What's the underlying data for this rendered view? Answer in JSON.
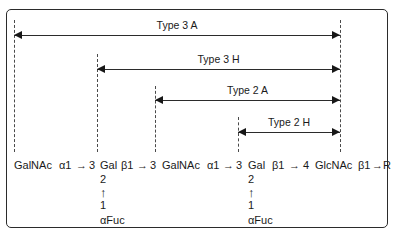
{
  "figure": {
    "name": "glycan-type-structure-diagram",
    "border_color": "#2b2b2b",
    "line_color": "#2b2b2b",
    "dash_color": "#4a4a4a"
  },
  "measures": [
    {
      "id": "type-3-a",
      "label": "Type 3 A",
      "left": 14,
      "right": 340,
      "y": 35,
      "label_y": 19
    },
    {
      "id": "type-3-h",
      "label": "Type 3 H",
      "left": 97,
      "right": 340,
      "y": 69,
      "label_y": 53
    },
    {
      "id": "type-2-a",
      "label": "Type 2 A",
      "left": 155,
      "right": 340,
      "y": 100,
      "label_y": 84
    },
    {
      "id": "type-2-h",
      "label": "Type 2 H",
      "left": 238,
      "right": 340,
      "y": 132,
      "label_y": 116
    }
  ],
  "guides": [
    {
      "id": "guide-galnac-1",
      "x": 14,
      "top": 20,
      "bottom": 152
    },
    {
      "id": "guide-gal-1",
      "x": 97,
      "top": 54,
      "bottom": 152
    },
    {
      "id": "guide-galnac-2",
      "x": 155,
      "top": 86,
      "bottom": 152
    },
    {
      "id": "guide-gal-2",
      "x": 238,
      "top": 117,
      "bottom": 152
    },
    {
      "id": "guide-terminus",
      "x": 340,
      "top": 20,
      "bottom": 152
    }
  ],
  "chain": {
    "segments": [
      {
        "id": "residue-galnac-1",
        "text": "GalNAc",
        "x": 14
      },
      {
        "id": "linkage-alpha1-1",
        "text": "α1",
        "x": 59
      },
      {
        "id": "arrow-1",
        "text": "→",
        "x": 76
      },
      {
        "id": "position-3-1",
        "text": "3",
        "x": 89
      },
      {
        "id": "residue-gal-1",
        "text": "Gal",
        "x": 100
      },
      {
        "id": "linkage-beta1-1",
        "text": "β1",
        "x": 121
      },
      {
        "id": "arrow-2",
        "text": "→",
        "x": 137
      },
      {
        "id": "position-3-2",
        "text": "3",
        "x": 150
      },
      {
        "id": "residue-galnac-2",
        "text": "GalNAc",
        "x": 162
      },
      {
        "id": "linkage-alpha1-2",
        "text": "α1",
        "x": 207
      },
      {
        "id": "arrow-3",
        "text": "→",
        "x": 223
      },
      {
        "id": "position-3-3",
        "text": "3",
        "x": 236
      },
      {
        "id": "residue-gal-2",
        "text": "Gal",
        "x": 248
      },
      {
        "id": "linkage-beta1-2",
        "text": "β1",
        "x": 272
      },
      {
        "id": "arrow-4",
        "text": "→",
        "x": 289
      },
      {
        "id": "position-4",
        "text": "4",
        "x": 303
      },
      {
        "id": "residue-glcnac",
        "text": "GlcNAc",
        "x": 315
      },
      {
        "id": "linkage-beta1-3",
        "text": "β1",
        "x": 358
      },
      {
        "id": "arrow-5",
        "text": "→",
        "x": 372
      },
      {
        "id": "residue-r",
        "text": "R",
        "x": 383
      }
    ]
  },
  "branches": [
    {
      "id": "fucose-branch-1",
      "x": 100,
      "y": 173,
      "upper_position": "2",
      "bond_arrow": "↑",
      "lower_position": "1",
      "residue": "αFuc"
    },
    {
      "id": "fucose-branch-2",
      "x": 248,
      "y": 173,
      "upper_position": "2",
      "bond_arrow": "↑",
      "lower_position": "1",
      "residue": "αFuc"
    }
  ]
}
